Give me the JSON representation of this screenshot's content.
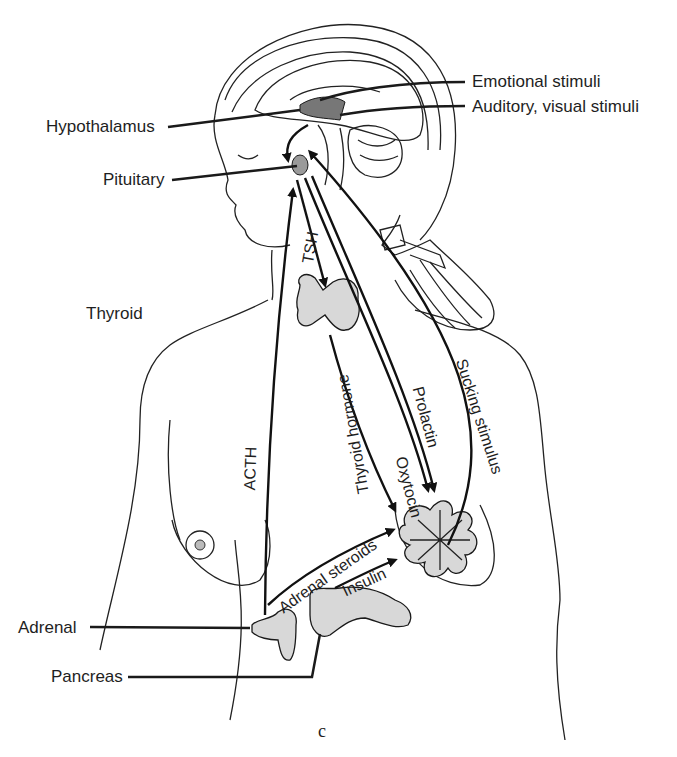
{
  "figure": {
    "panel_mark": "c",
    "colors": {
      "ink": "#1a1a1a",
      "gland_fill": "#d8d8d8",
      "background": "#ffffff"
    }
  },
  "labels": {
    "hypothalamus": "Hypothalamus",
    "pituitary": "Pituitary",
    "thyroid": "Thyroid",
    "adrenal": "Adrenal",
    "pancreas": "Pancreas",
    "emotional_stimuli": "Emotional stimuli",
    "auditory_visual_stimuli": "Auditory, visual stimuli"
  },
  "pathways": {
    "tsh": "TSH",
    "acth": "ACTH",
    "thyroid_hormone": "Thyroid hormone",
    "oxytocin": "Oxytocin",
    "prolactin": "Prolactin",
    "sucking_stimulus": "Sucking stimulus",
    "adrenal_steroids": "Adrenal steroids",
    "insulin": "Insulin"
  }
}
